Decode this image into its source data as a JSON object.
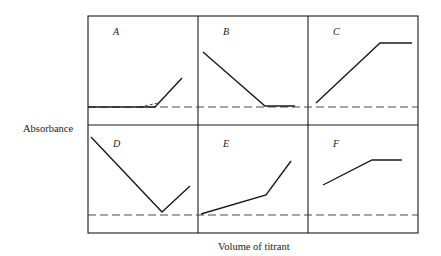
{
  "figure": {
    "y_axis_label": "Absorbance",
    "x_axis_label": "Volume of titrant",
    "line_color": "#1a1a1a",
    "grid": {
      "left": 88,
      "top": 16,
      "right": 418,
      "bottom": 233,
      "col_dividers": [
        198,
        308
      ],
      "row_divider": 125
    },
    "panels": [
      {
        "id": "A",
        "label": "A",
        "label_pos": [
          113,
          35
        ],
        "baseline_y": 107,
        "baseline_from": 88,
        "points": [
          [
            88,
            107
          ],
          [
            155,
            107
          ],
          [
            182,
            78
          ]
        ],
        "extrapolation": [
          [
            140,
            107
          ],
          [
            158,
            103
          ]
        ]
      },
      {
        "id": "B",
        "label": "B",
        "label_pos": [
          223,
          35
        ],
        "baseline_y": 107,
        "baseline_from": 198,
        "points": [
          [
            203,
            52
          ],
          [
            265,
            106
          ],
          [
            295,
            106
          ]
        ]
      },
      {
        "id": "C",
        "label": "C",
        "label_pos": [
          333,
          35
        ],
        "baseline_y": 107,
        "baseline_from": 308,
        "points": [
          [
            316,
            103
          ],
          [
            380,
            43
          ],
          [
            412,
            43
          ]
        ]
      },
      {
        "id": "D",
        "label": "D",
        "label_pos": [
          113,
          147
        ],
        "baseline_y": 215,
        "baseline_from": 88,
        "points": [
          [
            91,
            137
          ],
          [
            162,
            212
          ],
          [
            190,
            186
          ]
        ]
      },
      {
        "id": "E",
        "label": "E",
        "label_pos": [
          223,
          147
        ],
        "baseline_y": 215,
        "baseline_from": 198,
        "points": [
          [
            201,
            214
          ],
          [
            266,
            195
          ],
          [
            291,
            161
          ]
        ]
      },
      {
        "id": "F",
        "label": "F",
        "label_pos": [
          333,
          147
        ],
        "baseline_y": 215,
        "baseline_from": 308,
        "points": [
          [
            323,
            185
          ],
          [
            372,
            160
          ],
          [
            402,
            160
          ]
        ]
      }
    ]
  }
}
